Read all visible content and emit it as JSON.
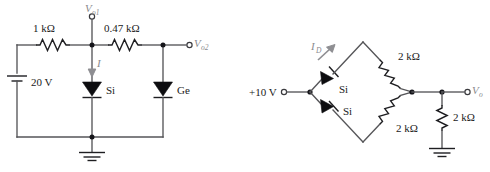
{
  "figure": {
    "type": "electronic-circuit-schematic",
    "background": "#ffffff",
    "wire_color": "#555558",
    "component_color": "#1e1e21",
    "panels": 2
  },
  "left_circuit": {
    "name": "series-parallel-diode-network",
    "source": {
      "label": "20 V",
      "type": "dc-battery"
    },
    "resistors": [
      {
        "label": "1 kΩ",
        "orientation": "horizontal",
        "position": "top-left"
      },
      {
        "label": "0.47 kΩ",
        "orientation": "horizontal",
        "position": "top-right"
      }
    ],
    "diodes": [
      {
        "label": "Si",
        "orientation": "vertical-down",
        "position": "center"
      },
      {
        "label": "Ge",
        "orientation": "vertical-down",
        "position": "right"
      }
    ],
    "current": {
      "label": "I",
      "direction": "down"
    },
    "terminals": [
      {
        "label": "V",
        "subscript": "o1",
        "position": "top-center"
      },
      {
        "label": "V",
        "subscript": "o2",
        "position": "right"
      }
    ],
    "ground": {
      "label": "ground",
      "position": "bottom-center"
    }
  },
  "right_circuit": {
    "name": "diode-bridge-network",
    "source": {
      "label": "+10 V",
      "type": "dc-terminal"
    },
    "diodes": [
      {
        "label": "Si",
        "position": "upper-left-branch"
      },
      {
        "label": "Si",
        "position": "lower-left-branch"
      }
    ],
    "resistors": [
      {
        "label": "2 kΩ",
        "position": "upper-right-branch"
      },
      {
        "label": "2 kΩ",
        "position": "lower-right-branch"
      },
      {
        "label": "2 kΩ",
        "position": "output-shunt"
      }
    ],
    "current": {
      "label": "I",
      "subscript": "D",
      "direction": "up-right"
    },
    "terminals": [
      {
        "label": "V",
        "subscript": "o",
        "position": "right"
      }
    ],
    "ground": {
      "label": "ground",
      "position": "bottom-right"
    }
  }
}
